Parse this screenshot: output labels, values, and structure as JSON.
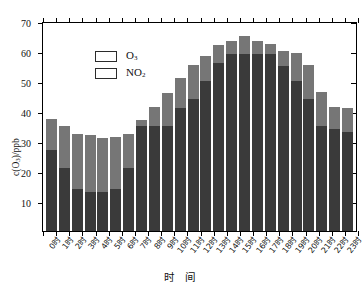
{
  "chart_data": {
    "type": "bar",
    "stacked": true,
    "title": "",
    "subtitle": "",
    "xlabel": "时 间",
    "ylabel": "c(O3)/ppb",
    "ylabel_parts": {
      "prefix": "c",
      "open": "(O",
      "sub": "3",
      "close": ")/ppb"
    },
    "ylim": [
      0,
      70
    ],
    "yticks": [
      10,
      20,
      30,
      40,
      50,
      60,
      70
    ],
    "ytick_labels": [
      "10",
      "20",
      "30",
      "40",
      "50",
      "60",
      "70"
    ],
    "grid": false,
    "legend_position": "top-left",
    "categories": [
      "0时",
      "1时",
      "2时",
      "3时",
      "4时",
      "5时",
      "6时",
      "7时",
      "8时",
      "9时",
      "10时",
      "11时",
      "12时",
      "13时",
      "14时",
      "15时",
      "16时",
      "17时",
      "18时",
      "19时",
      "20时",
      "21时",
      "22时",
      "23时"
    ],
    "series": [
      {
        "name": "O3",
        "name_parts": {
          "text": "O",
          "sub": "3"
        },
        "color": "#3a3a3a",
        "values": [
          27,
          21,
          14,
          13,
          13,
          14,
          21,
          35,
          35,
          35,
          41,
          44,
          50,
          56,
          59,
          59,
          59,
          59,
          55,
          50,
          44,
          35,
          34,
          33
        ]
      },
      {
        "name": "NO2",
        "name_parts": {
          "text": "NO",
          "sub": "2"
        },
        "color": "#767676",
        "values": [
          10.5,
          14,
          18.5,
          19,
          18,
          17.5,
          11.5,
          2,
          6.5,
          11,
          10,
          11.5,
          8.5,
          6,
          4.5,
          6,
          4.5,
          3.5,
          5,
          9.5,
          11.5,
          11.5,
          7.5,
          8
        ]
      }
    ],
    "totals": [
      37.5,
      35,
      32.5,
      32,
      31,
      31.5,
      32.5,
      37,
      41.5,
      46,
      51,
      55.5,
      58.5,
      62,
      63.5,
      65,
      63.5,
      62.5,
      60,
      59.5,
      55.5,
      46.5,
      41.5,
      41
    ]
  },
  "legend": {
    "items": [
      {
        "label": "O3",
        "color": "#3a3a3a"
      },
      {
        "label": "NO2",
        "color": "#767676"
      }
    ]
  },
  "colors": {
    "o3": "#3a3a3a",
    "no2": "#767676",
    "axis": "#000000",
    "background": "#ffffff"
  }
}
